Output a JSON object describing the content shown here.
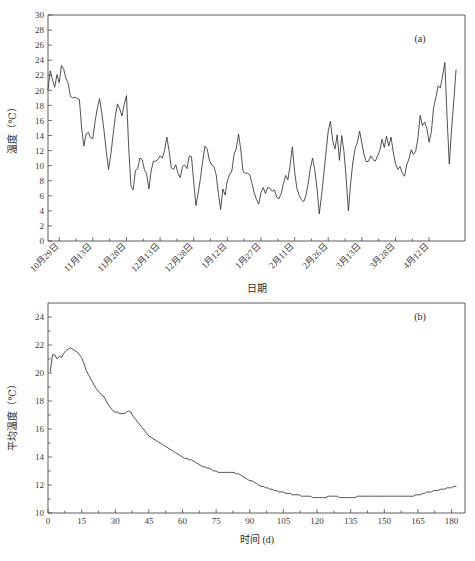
{
  "figure": {
    "title": "",
    "panels": [
      "a",
      "b"
    ],
    "line_color": "#333333",
    "axis_color": "#4a4a4a",
    "background": "#ffffff"
  },
  "panel_a": {
    "tag": "(a)",
    "xlabel": "日期",
    "ylabel": "温度（℃）",
    "yticks": [
      "0",
      "2",
      "4",
      "6",
      "8",
      "10",
      "12",
      "14",
      "16",
      "18",
      "20",
      "22",
      "24",
      "26",
      "28",
      "30"
    ],
    "xticks": [
      "10月29日",
      "11月13日",
      "11月28日",
      "12月13日",
      "12月28日",
      "1月12日",
      "1月27日",
      "2月11日",
      "2月26日",
      "3月13日",
      "3月28日",
      "4月12日"
    ]
  },
  "panel_b": {
    "tag": "(b)",
    "xlabel": "时间 (d)",
    "ylabel": "平均温度（℃）",
    "yticks": [
      "10",
      "12",
      "14",
      "16",
      "18",
      "20",
      "22",
      "24"
    ],
    "xticks": [
      "0",
      "15",
      "30",
      "45",
      "60",
      "75",
      "90",
      "105",
      "120",
      "135",
      "150",
      "165",
      "180"
    ]
  },
  "chart_data": [
    {
      "type": "line",
      "panel": "a",
      "title": "(a)",
      "xlabel": "日期",
      "ylabel": "温度（℃）",
      "xlim": [
        0,
        186
      ],
      "ylim": [
        0,
        30
      ],
      "ytick_values": [
        0,
        2,
        4,
        6,
        8,
        10,
        12,
        14,
        16,
        18,
        20,
        22,
        24,
        26,
        28,
        30
      ],
      "xtick_values": [
        5,
        20,
        35,
        50,
        65,
        80,
        95,
        110,
        125,
        140,
        155,
        170
      ],
      "xtick_labels": [
        "10月29日",
        "11月13日",
        "11月28日",
        "12月13日",
        "12月28日",
        "1月12日",
        "1月27日",
        "2月11日",
        "2月26日",
        "3月13日",
        "3月28日",
        "4月12日"
      ],
      "grid": false,
      "legend": "none",
      "series": [
        {
          "name": "日均温度",
          "x": [
            0,
            1,
            2,
            3,
            4,
            5,
            6,
            7,
            8,
            9,
            10,
            11,
            12,
            13,
            14,
            15,
            16,
            17,
            18,
            19,
            20,
            21,
            22,
            23,
            24,
            25,
            26,
            27,
            28,
            29,
            30,
            31,
            32,
            33,
            34,
            35,
            36,
            37,
            38,
            39,
            40,
            41,
            42,
            43,
            44,
            45,
            46,
            47,
            48,
            49,
            50,
            51,
            52,
            53,
            54,
            55,
            56,
            57,
            58,
            59,
            60,
            61,
            62,
            63,
            64,
            65,
            66,
            67,
            68,
            69,
            70,
            71,
            72,
            73,
            74,
            75,
            76,
            77,
            78,
            79,
            80,
            81,
            82,
            83,
            84,
            85,
            86,
            87,
            88,
            89,
            90,
            91,
            92,
            93,
            94,
            95,
            96,
            97,
            98,
            99,
            100,
            101,
            102,
            103,
            104,
            105,
            106,
            107,
            108,
            109,
            110,
            111,
            112,
            113,
            114,
            115,
            116,
            117,
            118,
            119,
            120,
            121,
            122,
            123,
            124,
            125,
            126,
            127,
            128,
            129,
            130,
            131,
            132,
            133,
            134,
            135,
            136,
            137,
            138,
            139,
            140,
            141,
            142,
            143,
            144,
            145,
            146,
            147,
            148,
            149,
            150,
            151,
            152,
            153,
            154,
            155,
            156,
            157,
            158,
            159,
            160,
            161,
            162,
            163,
            164,
            165,
            166,
            167,
            168,
            169,
            170,
            171,
            172,
            173,
            174,
            175,
            176,
            177,
            178,
            179,
            180,
            181,
            182,
            183,
            184
          ],
          "values": [
            20.1,
            22.6,
            21.4,
            20.4,
            22.1,
            21.0,
            23.3,
            22.8,
            21.6,
            20.9,
            19.2,
            19.0,
            19.1,
            18.9,
            18.8,
            15.0,
            12.6,
            14.2,
            14.4,
            13.7,
            13.6,
            15.9,
            17.6,
            18.9,
            17.0,
            14.6,
            11.9,
            9.5,
            11.4,
            14.0,
            16.5,
            18.2,
            17.5,
            16.6,
            18.1,
            19.3,
            12.4,
            7.3,
            6.8,
            9.4,
            9.6,
            11.0,
            10.8,
            9.5,
            8.9,
            6.9,
            9.3,
            10.6,
            10.6,
            10.8,
            11.3,
            11.0,
            12.0,
            13.8,
            12.0,
            9.7,
            9.5,
            10.1,
            9.0,
            8.4,
            9.9,
            10.1,
            9.6,
            11.3,
            11.2,
            7.8,
            4.7,
            6.4,
            8.3,
            10.6,
            12.6,
            12.2,
            10.7,
            10.1,
            9.9,
            8.8,
            6.3,
            4.2,
            6.9,
            6.1,
            8.0,
            8.8,
            9.3,
            11.5,
            12.3,
            14.2,
            12.1,
            9.2,
            9.0,
            9.0,
            8.8,
            7.6,
            6.4,
            5.5,
            4.9,
            6.4,
            7.1,
            6.3,
            7.1,
            7.0,
            6.6,
            6.8,
            5.8,
            5.6,
            6.3,
            7.6,
            8.7,
            8.1,
            10.1,
            12.5,
            9.2,
            7.0,
            6.1,
            5.5,
            5.2,
            6.0,
            7.5,
            9.6,
            11.0,
            9.4,
            7.0,
            3.6,
            6.0,
            8.8,
            11.8,
            14.6,
            15.9,
            13.3,
            12.2,
            14.1,
            10.7,
            14.0,
            11.9,
            8.3,
            4.0,
            7.7,
            10.5,
            12.3,
            13.1,
            14.6,
            13.0,
            11.4,
            10.5,
            10.6,
            11.3,
            10.8,
            10.6,
            11.3,
            12.0,
            13.5,
            12.4,
            13.9,
            12.6,
            13.8,
            11.8,
            10.3,
            9.5,
            9.9,
            9.0,
            8.6,
            10.1,
            10.9,
            12.1,
            11.5,
            11.9,
            13.6,
            16.7,
            15.3,
            15.8,
            14.9,
            13.1,
            14.5,
            17.7,
            19.0,
            20.6,
            20.3,
            21.9,
            23.7,
            16.5,
            10.2,
            14.8,
            18.6,
            22.7
          ]
        }
      ]
    },
    {
      "type": "line",
      "panel": "b",
      "title": "(b)",
      "xlabel": "时间 (d)",
      "ylabel": "平均温度（℃）",
      "xlim": [
        0,
        186
      ],
      "ylim": [
        10,
        25
      ],
      "ytick_values": [
        10,
        12,
        14,
        16,
        18,
        20,
        22,
        24
      ],
      "xtick_values": [
        0,
        15,
        30,
        45,
        60,
        75,
        90,
        105,
        120,
        135,
        150,
        165,
        180
      ],
      "xtick_labels": [
        "0",
        "15",
        "30",
        "45",
        "60",
        "75",
        "90",
        "105",
        "120",
        "135",
        "150",
        "165",
        "180"
      ],
      "grid": false,
      "legend": "none",
      "series": [
        {
          "name": "累计平均温度",
          "x": [
            1,
            2,
            3,
            4,
            5,
            6,
            7,
            8,
            9,
            10,
            11,
            12,
            13,
            14,
            15,
            16,
            17,
            18,
            19,
            20,
            21,
            22,
            23,
            24,
            25,
            26,
            27,
            28,
            29,
            30,
            31,
            32,
            33,
            34,
            35,
            36,
            37,
            38,
            39,
            40,
            41,
            42,
            43,
            44,
            45,
            46,
            47,
            48,
            49,
            50,
            51,
            52,
            53,
            54,
            55,
            56,
            57,
            58,
            59,
            60,
            61,
            62,
            63,
            64,
            65,
            66,
            67,
            68,
            69,
            70,
            71,
            72,
            73,
            74,
            75,
            76,
            77,
            78,
            79,
            80,
            81,
            82,
            83,
            84,
            85,
            86,
            87,
            88,
            89,
            90,
            91,
            92,
            93,
            94,
            95,
            96,
            97,
            98,
            99,
            100,
            101,
            102,
            103,
            104,
            105,
            106,
            107,
            108,
            109,
            110,
            111,
            112,
            113,
            114,
            115,
            116,
            117,
            118,
            119,
            120,
            121,
            122,
            123,
            124,
            125,
            126,
            127,
            128,
            129,
            130,
            131,
            132,
            133,
            134,
            135,
            136,
            137,
            138,
            139,
            140,
            141,
            142,
            143,
            144,
            145,
            146,
            147,
            148,
            149,
            150,
            151,
            152,
            153,
            154,
            155,
            156,
            157,
            158,
            159,
            160,
            161,
            162,
            163,
            164,
            165,
            166,
            167,
            168,
            169,
            170,
            171,
            172,
            173,
            174,
            175,
            176,
            177,
            178,
            179,
            180,
            181,
            182,
            183,
            184
          ],
          "values": [
            20.1,
            21.3,
            21.3,
            21.0,
            21.2,
            21.1,
            21.4,
            21.6,
            21.7,
            21.8,
            21.7,
            21.6,
            21.5,
            21.3,
            21.1,
            20.7,
            20.2,
            19.9,
            19.6,
            19.3,
            19.0,
            18.8,
            18.6,
            18.4,
            18.3,
            18.0,
            17.7,
            17.5,
            17.3,
            17.2,
            17.2,
            17.1,
            17.1,
            17.1,
            17.2,
            17.3,
            17.2,
            16.9,
            16.7,
            16.5,
            16.3,
            16.1,
            15.9,
            15.7,
            15.5,
            15.4,
            15.3,
            15.2,
            15.1,
            15.0,
            14.9,
            14.8,
            14.7,
            14.6,
            14.5,
            14.4,
            14.3,
            14.2,
            14.1,
            14.0,
            13.9,
            13.9,
            13.8,
            13.8,
            13.7,
            13.6,
            13.5,
            13.4,
            13.3,
            13.3,
            13.2,
            13.2,
            13.1,
            13.0,
            13.0,
            12.9,
            12.9,
            12.9,
            12.9,
            12.9,
            12.9,
            12.9,
            12.9,
            12.8,
            12.8,
            12.7,
            12.6,
            12.5,
            12.4,
            12.3,
            12.3,
            12.2,
            12.1,
            12.0,
            11.9,
            11.9,
            11.8,
            11.8,
            11.7,
            11.7,
            11.6,
            11.6,
            11.5,
            11.5,
            11.5,
            11.4,
            11.4,
            11.4,
            11.3,
            11.3,
            11.3,
            11.3,
            11.2,
            11.2,
            11.2,
            11.2,
            11.2,
            11.1,
            11.1,
            11.1,
            11.1,
            11.1,
            11.1,
            11.1,
            11.2,
            11.2,
            11.2,
            11.2,
            11.2,
            11.1,
            11.1,
            11.1,
            11.1,
            11.1,
            11.1,
            11.1,
            11.1,
            11.2,
            11.2,
            11.2,
            11.2,
            11.2,
            11.2,
            11.2,
            11.2,
            11.2,
            11.2,
            11.2,
            11.2,
            11.2,
            11.2,
            11.2,
            11.2,
            11.2,
            11.2,
            11.2,
            11.2,
            11.2,
            11.2,
            11.2,
            11.2,
            11.2,
            11.2,
            11.3,
            11.3,
            11.3,
            11.4,
            11.4,
            11.5,
            11.5,
            11.5,
            11.6,
            11.6,
            11.6,
            11.7,
            11.7,
            11.7,
            11.8,
            11.8,
            11.8,
            11.9,
            11.9
          ]
        }
      ]
    }
  ]
}
